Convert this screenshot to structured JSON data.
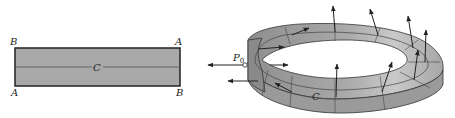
{
  "left_figure": {
    "corner_top_left": "B",
    "corner_top_right": "A",
    "corner_bottom_left": "A",
    "corner_bottom_right": "B",
    "center_label": "C",
    "fill_color": "#a8a8a8",
    "border_color": "#222222"
  },
  "right_figure": {
    "point_label": "P",
    "point_subscript": "0",
    "curve_label": "C",
    "surface_color": "#a0a0a0",
    "normal_vector_count": 12
  }
}
